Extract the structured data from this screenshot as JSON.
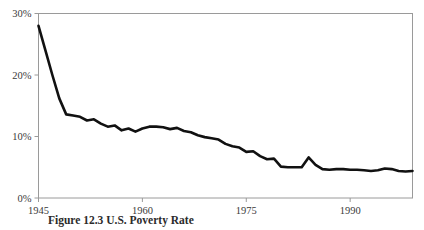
{
  "figure": {
    "caption": "Figure 12.3   U.S. Poverty Rate"
  },
  "chart_data": {
    "type": "line",
    "title": "",
    "subtitle": "",
    "xlabel": "",
    "ylabel": "",
    "xlim": [
      1945,
      1999
    ],
    "ylim": [
      0,
      30
    ],
    "grid": false,
    "legend": null,
    "x_tick_labels": [
      "1945",
      "1960",
      "1975",
      "1990"
    ],
    "x_ticks": [
      1945,
      1960,
      1975,
      1990
    ],
    "y_tick_labels": [
      "0%",
      "10%",
      "20%",
      "30%"
    ],
    "y_ticks": [
      0,
      10,
      20,
      30
    ],
    "line_color": "#111111",
    "axis_color": "#9a9a9a",
    "series": [
      {
        "name": "rate",
        "x": [
          1945,
          1946,
          1947,
          1948,
          1949,
          1950,
          1951,
          1952,
          1953,
          1954,
          1955,
          1956,
          1957,
          1958,
          1959,
          1960,
          1961,
          1962,
          1963,
          1964,
          1965,
          1966,
          1967,
          1968,
          1969,
          1970,
          1971,
          1972,
          1973,
          1974,
          1975,
          1976,
          1977,
          1978,
          1979,
          1980,
          1981,
          1982,
          1983,
          1984,
          1985,
          1986,
          1987,
          1988,
          1989,
          1990,
          1991,
          1992,
          1993,
          1994,
          1995,
          1996,
          1997,
          1998,
          1999
        ],
        "values": [
          28.0,
          24.0,
          20.0,
          16.2,
          13.6,
          13.4,
          13.2,
          12.6,
          12.8,
          12.1,
          11.6,
          11.8,
          11.0,
          11.3,
          10.8,
          11.3,
          11.6,
          11.6,
          11.5,
          11.2,
          11.4,
          10.9,
          10.7,
          10.2,
          9.9,
          9.7,
          9.5,
          8.8,
          8.4,
          8.2,
          7.5,
          7.6,
          6.8,
          6.3,
          6.4,
          5.1,
          5.0,
          5.0,
          5.0,
          6.6,
          5.4,
          4.7,
          4.6,
          4.7,
          4.7,
          4.6,
          4.6,
          4.5,
          4.4,
          4.5,
          4.8,
          4.7,
          4.4,
          4.3,
          4.4
        ]
      }
    ]
  }
}
